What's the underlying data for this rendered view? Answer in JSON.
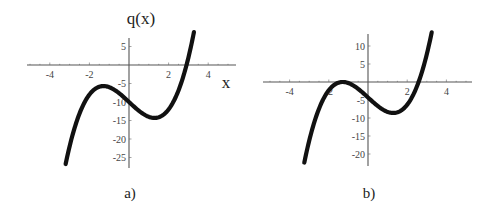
{
  "chart_data": [
    {
      "type": "line",
      "panel_label": "a)",
      "ylabel": "q(x)",
      "xlabel": "x",
      "function": "q(x) = x^3 - 5x - 10",
      "coeffs": {
        "a": 1,
        "b": 0,
        "c": -5,
        "d": -10
      },
      "x_range": [
        -3.2,
        3.28
      ],
      "xlim": [
        -5.2,
        5.2
      ],
      "ylim": [
        -28,
        8
      ],
      "xticks": [
        -4,
        -2,
        2,
        4
      ],
      "yticks": [
        5,
        -5,
        -10,
        -15,
        -20,
        -25
      ],
      "key_points": {
        "local_max": [
          -1.29,
          -5.7
        ],
        "local_min": [
          1.29,
          -14.3
        ],
        "y_intercept": [
          0,
          -10
        ],
        "root": [
          2.9,
          0
        ]
      },
      "geom": {
        "ox": 129,
        "oy": 65,
        "sx": 19.8,
        "sy": 3.7,
        "xaxis": [
          27,
          236
        ],
        "yaxis": [
          38,
          168
        ]
      },
      "grid": false,
      "legend": null
    },
    {
      "type": "line",
      "panel_label": "b)",
      "ylabel": "",
      "xlabel": "",
      "function": "x^3 - 5x - 4.3",
      "coeffs": {
        "a": 1,
        "b": 0,
        "c": -5,
        "d": -4.3
      },
      "x_range": [
        -3.25,
        3.25
      ],
      "xlim": [
        -5.2,
        5.2
      ],
      "ylim": [
        -23,
        14
      ],
      "xticks": [
        -4,
        -2,
        2,
        4
      ],
      "yticks": [
        10,
        5,
        -5,
        -10,
        -15,
        -20
      ],
      "key_points": {
        "local_max": [
          -1.29,
          0
        ],
        "local_min": [
          1.29,
          -8.6
        ],
        "y_intercept": [
          0,
          -4.3
        ],
        "root": [
          2.5,
          0
        ]
      },
      "geom": {
        "ox": 368,
        "oy": 82,
        "sx": 19.6,
        "sy": 3.6,
        "xaxis": [
          263,
          472
        ],
        "yaxis": [
          34,
          166
        ]
      },
      "grid": false,
      "legend": null
    }
  ]
}
